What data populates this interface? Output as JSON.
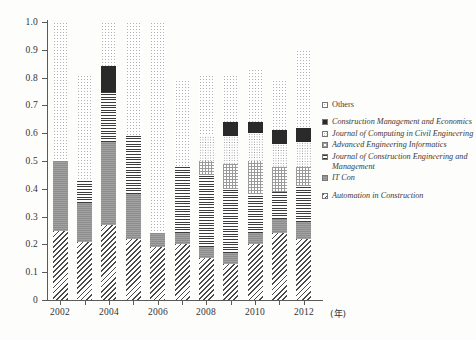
{
  "chart_data": {
    "type": "bar",
    "subtype": "stacked-bar",
    "title": "",
    "xlabel": "(年)",
    "ylabel": "",
    "ylim": [
      0,
      1.0
    ],
    "ytick_labels": [
      "0",
      "0.1",
      "0.2",
      "0.3",
      "0.4",
      "0.5",
      "0.6",
      "0.7",
      "0.8",
      "0.9",
      "1.0"
    ],
    "ytick_values": [
      0,
      0.1,
      0.2,
      0.3,
      0.4,
      0.5,
      0.6,
      0.7,
      0.8,
      0.9,
      1.0
    ],
    "grid": false,
    "legend_position": "right",
    "categories": [
      "2002",
      "2003",
      "2004",
      "2005",
      "2006",
      "2007",
      "2008",
      "2009",
      "2010",
      "2011",
      "2012"
    ],
    "xtick_labels": [
      "2002",
      "",
      "2004",
      "",
      "2006",
      "",
      "2008",
      "",
      "2010",
      "",
      "2012"
    ],
    "series": [
      {
        "name": "Automation in Construction",
        "pattern": "diagonal-hatch",
        "values": [
          0.25,
          0.21,
          0.27,
          0.22,
          0.19,
          0.2,
          0.15,
          0.13,
          0.2,
          0.24,
          0.22
        ]
      },
      {
        "name": "IT Con",
        "pattern": "solid-grey",
        "values": [
          0.25,
          0.14,
          0.3,
          0.16,
          0.05,
          0.04,
          0.04,
          0.04,
          0.04,
          0.05,
          0.06
        ]
      },
      {
        "name": "Journal of Construction Engineering and Management",
        "pattern": "horizontal-lines",
        "values": [
          0.0,
          0.08,
          0.18,
          0.21,
          0.0,
          0.24,
          0.26,
          0.23,
          0.14,
          0.1,
          0.13
        ]
      },
      {
        "name": "Advanced Engineering Informatics",
        "pattern": "light-checker",
        "values": [
          0.0,
          0.0,
          0.0,
          0.0,
          0.0,
          0.0,
          0.05,
          0.09,
          0.12,
          0.09,
          0.07
        ]
      },
      {
        "name": "Journal of Computing in Civil Engineering",
        "pattern": "light-dotted",
        "values": [
          0.0,
          0.0,
          0.0,
          0.0,
          0.0,
          0.0,
          0.09,
          0.1,
          0.1,
          0.08,
          0.09
        ]
      },
      {
        "name": "Construction Management and Economics",
        "pattern": "solid-dark",
        "values": [
          0.0,
          0.0,
          0.09,
          0.0,
          0.0,
          0.0,
          0.0,
          0.05,
          0.04,
          0.05,
          0.05
        ]
      },
      {
        "name": "Others",
        "pattern": "speckle",
        "values": [
          0.5,
          0.38,
          0.16,
          0.41,
          0.76,
          0.31,
          0.22,
          0.17,
          0.19,
          0.18,
          0.28
        ]
      }
    ],
    "bar_totals": [
      1.0,
      0.62,
      0.84,
      0.6,
      0.76,
      0.58,
      0.78,
      0.7,
      0.72,
      0.82,
      0.75
    ]
  },
  "legend": {
    "items": [
      {
        "label": "Others",
        "pattern": "p-others",
        "italic": false,
        "gap": false
      },
      {
        "label": "Construction Management and Economics",
        "pattern": "p-cme",
        "italic": true,
        "gap": true
      },
      {
        "label": "Journal of Computing in Civil Engineering",
        "pattern": "p-jcce",
        "italic": true,
        "gap": false
      },
      {
        "label": "Advanced Engineering Informatics",
        "pattern": "p-aei",
        "italic": true,
        "gap": false
      },
      {
        "label": "Journal of Construction Engineering and Management",
        "pattern": "p-jcem",
        "italic": true,
        "gap": false
      },
      {
        "label": "IT Con",
        "pattern": "p-itcon",
        "italic": true,
        "gap": false
      },
      {
        "label": "Automation in Construction",
        "pattern": "p-automation",
        "italic": true,
        "gap": true
      }
    ]
  },
  "axes": {
    "x_unit_label": "(年)"
  }
}
